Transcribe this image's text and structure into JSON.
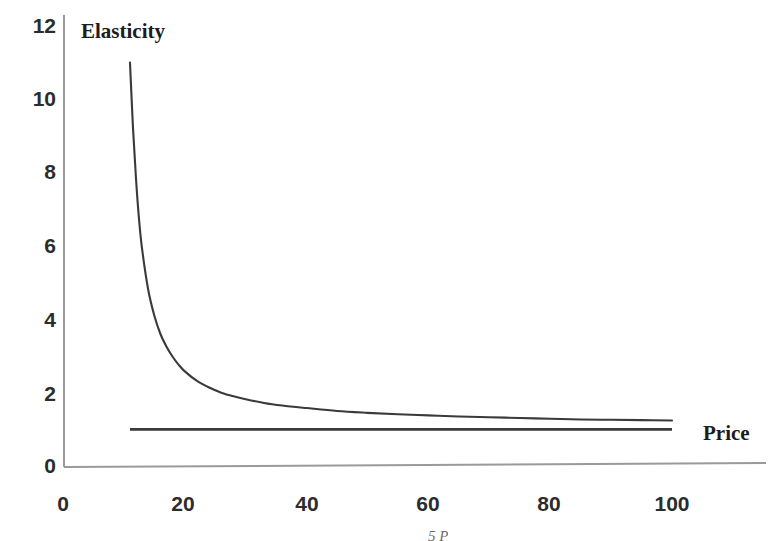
{
  "chart_data": {
    "type": "line",
    "title": "",
    "xlabel": "Price",
    "ylabel": "Elasticity",
    "xlim": [
      0,
      110
    ],
    "ylim": [
      0,
      12
    ],
    "grid": false,
    "legend": null,
    "x_ticks": [
      0,
      20,
      40,
      60,
      80,
      100
    ],
    "y_ticks": [
      0,
      2,
      4,
      6,
      8,
      10,
      12
    ],
    "annotations": [
      "5 P"
    ],
    "series": [
      {
        "name": "Elasticity curve",
        "type": "line",
        "color": "#3a3a3a",
        "x": [
          11,
          11.5,
          12,
          12.5,
          13,
          14,
          15,
          16,
          17,
          18,
          19,
          20,
          22,
          24,
          26,
          28,
          30,
          33,
          36,
          40,
          45,
          50,
          55,
          60,
          65,
          70,
          75,
          80,
          85,
          90,
          95,
          100
        ],
        "values": [
          11.0,
          9.2,
          7.8,
          6.7,
          5.9,
          4.8,
          4.1,
          3.6,
          3.25,
          2.98,
          2.76,
          2.58,
          2.32,
          2.14,
          2.0,
          1.9,
          1.82,
          1.72,
          1.65,
          1.58,
          1.5,
          1.45,
          1.41,
          1.38,
          1.35,
          1.33,
          1.31,
          1.29,
          1.27,
          1.26,
          1.25,
          1.24
        ]
      },
      {
        "name": "Unit elasticity reference line",
        "type": "line",
        "color": "#3a3a3a",
        "x": [
          11,
          100
        ],
        "values": [
          1.0,
          1.0
        ]
      }
    ]
  },
  "labels": {
    "y_axis_title": "Elasticity",
    "x_axis_title": "Price",
    "bottom_fragment": "5 P",
    "y_tick_labels": [
      "12",
      "10",
      "8",
      "6",
      "4",
      "2",
      "0"
    ],
    "x_tick_labels": [
      "0",
      "20",
      "40",
      "60",
      "80",
      "100"
    ]
  },
  "colors": {
    "curve": "#3a3a3a",
    "reference_line": "#3a3a3a",
    "axis": "#8a8a8a",
    "text": "#2c2c2c",
    "background": "#ffffff"
  }
}
